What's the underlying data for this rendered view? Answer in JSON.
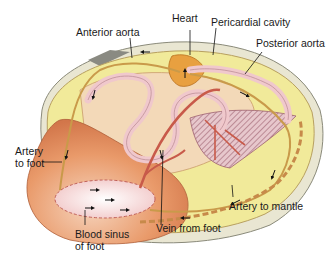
{
  "diagram": {
    "labels": {
      "heart": "Heart",
      "pericardial_cavity": "Pericardial cavity",
      "anterior_aorta": "Anterior aorta",
      "posterior_aorta": "Posterior aorta",
      "artery_to_foot_line1": "Artery",
      "artery_to_foot_line2": "to foot",
      "blood_sinus_line1": "Blood sinus",
      "blood_sinus_line2": "of foot",
      "vein_from_foot": "Vein from foot",
      "artery_to_mantle": "Artery to mantle"
    },
    "colors": {
      "shell_outer": "#e9e6d2",
      "mantle": "#f1ea9a",
      "foot": "#e08a5a",
      "foot_light": "#f4c7a8",
      "sinus": "#f7dede",
      "vessel_red": "#c85a4a",
      "vessel_pink": "#f0c8cc",
      "heart": "#e8a040",
      "gill_hatch": "#b77a86",
      "artery_line": "#c99a4a"
    }
  }
}
